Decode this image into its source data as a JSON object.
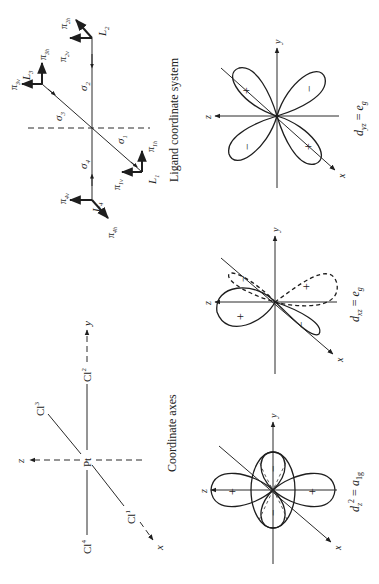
{
  "figure": {
    "coordinate_axes": {
      "caption": "Coordinate axes",
      "center_atom": "Pt",
      "ligands": [
        {
          "name": "Cl",
          "index": "1"
        },
        {
          "name": "Cl",
          "index": "2"
        },
        {
          "name": "Cl",
          "index": "3"
        },
        {
          "name": "Cl",
          "index": "4"
        }
      ],
      "axes": {
        "x": "x",
        "y": "y",
        "z": "z"
      }
    },
    "ligand_system": {
      "caption": "Ligand coordinate system",
      "ligands": [
        {
          "L": "L",
          "sub": "1",
          "sigma": "σ",
          "sigma_sub": "1",
          "pi_v": "π",
          "pi_v_sub": "1v",
          "pi_h": "π",
          "pi_h_sub": "1h"
        },
        {
          "L": "L",
          "sub": "2",
          "sigma": "σ",
          "sigma_sub": "2",
          "pi_v": "π",
          "pi_v_sub": "2v",
          "pi_h": "π",
          "pi_h_sub": "2h"
        },
        {
          "L": "L",
          "sub": "3",
          "sigma": "σ",
          "sigma_sub": "3",
          "pi_v": "π",
          "pi_v_sub": "3v",
          "pi_h": "π",
          "pi_h_sub": "3h"
        },
        {
          "L": "L",
          "sub": "4",
          "sigma": "σ",
          "sigma_sub": "4",
          "pi_v": "π",
          "pi_v_sub": "4v",
          "pi_h": "π",
          "pi_h_sub": "4h"
        }
      ]
    },
    "orbitals": [
      {
        "name": "d",
        "sub": "z",
        "sup": "2",
        "eq": " = ",
        "sym": "a",
        "sym_sub": "1g",
        "signs": [
          "+",
          "+",
          "−",
          "−"
        ]
      },
      {
        "name": "d",
        "sub": "xz",
        "sup": "",
        "eq": " = ",
        "sym": "e",
        "sym_sub": "g",
        "signs": [
          "+",
          "−",
          "−",
          "+"
        ]
      },
      {
        "name": "d",
        "sub": "yz",
        "sup": "",
        "eq": " = ",
        "sym": "e",
        "sym_sub": "g",
        "signs": [
          "+",
          "−",
          "−",
          "+"
        ]
      }
    ],
    "axis_labels": {
      "x": "x",
      "y": "y",
      "z": "z"
    }
  }
}
